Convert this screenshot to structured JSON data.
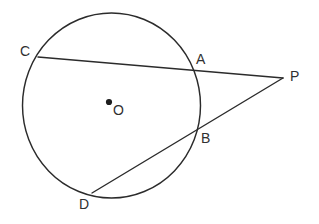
{
  "figure": {
    "kind": "circle-secants-geometry-diagram",
    "width": 319,
    "height": 224,
    "background_color": "#ffffff",
    "stroke_color": "#2b2b2b",
    "label_color": "#303030"
  },
  "circle": {
    "name": "circle-O",
    "center_x": 111.5,
    "center_y": 105.5,
    "radius_x": 89,
    "radius_y": 92.5
  },
  "center_marker": {
    "name": "center-point-dot",
    "x": 109,
    "y": 102,
    "radius": 3.1
  },
  "points": [
    {
      "id": "C",
      "label": "C",
      "x": 38,
      "y": 58,
      "label_x": 20,
      "label_y": 44
    },
    {
      "id": "A",
      "label": "A",
      "x": 193,
      "y": 68,
      "label_x": 196,
      "label_y": 52
    },
    {
      "id": "P",
      "label": "P",
      "x": 283,
      "y": 78,
      "label_x": 290,
      "label_y": 69
    },
    {
      "id": "B",
      "label": "B",
      "x": 196,
      "y": 132,
      "label_x": 201,
      "label_y": 131
    },
    {
      "id": "D",
      "label": "D",
      "x": 92,
      "y": 193,
      "label_x": 79,
      "label_y": 197
    },
    {
      "id": "O",
      "label": "O",
      "x": 109,
      "y": 102,
      "label_x": 113,
      "label_y": 103
    }
  ],
  "segments": [
    {
      "id": "CP",
      "label": "C-A-P secant",
      "x1": 38,
      "y1": 57,
      "x2": 283,
      "y2": 78
    },
    {
      "id": "DP",
      "label": "D-B-P secant",
      "x1": 92,
      "y1": 193,
      "x2": 283,
      "y2": 78
    }
  ],
  "chart_data": {
    "type": "diagram",
    "title": "",
    "shapes": [
      {
        "shape": "ellipse",
        "name": "circle-O",
        "cx": 111.5,
        "cy": 105.5,
        "rx": 89,
        "ry": 92.5
      },
      {
        "shape": "line",
        "name": "secant-CP",
        "from": "C",
        "to": "P",
        "through": "A"
      },
      {
        "shape": "line",
        "name": "secant-DP",
        "from": "D",
        "to": "P",
        "through": "B"
      },
      {
        "shape": "dot",
        "name": "center-O",
        "cx": 109,
        "cy": 102
      }
    ],
    "labels": [
      "C",
      "A",
      "P",
      "B",
      "D",
      "O"
    ]
  }
}
